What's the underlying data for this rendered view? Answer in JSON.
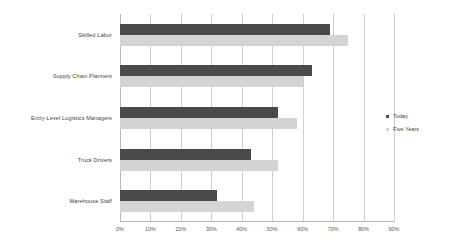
{
  "chart_data": {
    "type": "bar",
    "orientation": "horizontal",
    "title": "",
    "xlabel": "",
    "ylabel": "",
    "xlim": [
      0,
      90
    ],
    "xtick_labels": [
      "0%",
      "10%",
      "20%",
      "30%",
      "40%",
      "50%",
      "60%",
      "70%",
      "80%",
      "90%"
    ],
    "xticks": [
      0,
      10,
      20,
      30,
      40,
      50,
      60,
      70,
      80,
      90
    ],
    "grid": true,
    "legend_position": "right",
    "categories": [
      "Skilled Labor",
      "Supply Chain Planners",
      "Entry-Level Logistics Managers",
      "Truck Drivers",
      "Warehouse Staff"
    ],
    "series": [
      {
        "name": "Today",
        "color": "#4a4a4a",
        "values": [
          69,
          63,
          52,
          43,
          32
        ]
      },
      {
        "name": "Five Years",
        "color": "#d4d4d4",
        "values": [
          75,
          60,
          58,
          52,
          44
        ]
      }
    ]
  },
  "colors": {
    "today": "#4a4a4a",
    "five_years": "#d4d4d4",
    "gridline": "#cfcfcf",
    "axis": "#b8b8b8",
    "text": "#3f3f3f",
    "background": "#ffffff"
  }
}
